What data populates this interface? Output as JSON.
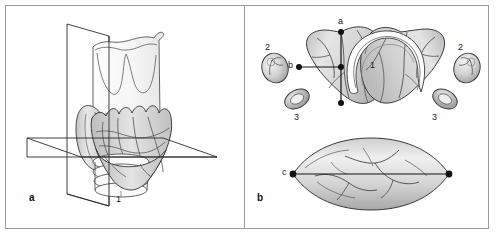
{
  "figure": {
    "background": "#ffffff",
    "frame_color": "#9a9a9a"
  },
  "panels": [
    {
      "letter": "a",
      "name": "three-dimensional-thyroid-with-section-planes",
      "labels": [
        {
          "text": "1",
          "meaning": "trachea",
          "x": 118,
          "y": 200
        }
      ]
    },
    {
      "letter": "b",
      "name": "cross-sectional-views-with-measurement-axes",
      "labels": [
        {
          "text": "1",
          "meaning": "trachea",
          "x": 372,
          "y": 65
        },
        {
          "text": "2",
          "meaning": "parathyroid-gland-superior-left",
          "x": 267,
          "y": 48
        },
        {
          "text": "2",
          "meaning": "parathyroid-gland-superior-right",
          "x": 460,
          "y": 48
        },
        {
          "text": "3",
          "meaning": "parathyroid-gland-inferior-left",
          "x": 296,
          "y": 118
        },
        {
          "text": "3",
          "meaning": "parathyroid-gland-inferior-right",
          "x": 434,
          "y": 118
        },
        {
          "text": "a",
          "meaning": "craniocaudal-axis-marker",
          "x": 340,
          "y": 21
        },
        {
          "text": "b",
          "meaning": "transverse-width-axis-marker",
          "x": 289,
          "y": 62
        },
        {
          "text": "c",
          "meaning": "longitudinal-axis-marker",
          "x": 297,
          "y": 173
        }
      ]
    }
  ],
  "colors": {
    "outline": "#3a3a3a",
    "tissue_fill_light": "#ececec",
    "tissue_fill_mid": "#d7d7d7",
    "tissue_fill_dark": "#bcbcbc",
    "vessel": "#555555",
    "axis_line": "#141414",
    "marker_dot": "#111111",
    "plane_line": "#2b2b2b",
    "frame": "#9a9a9a",
    "text": "#111111"
  },
  "legend": {
    "1": "Trachea",
    "2": "Superior parathyroid gland",
    "3": "Inferior parathyroid gland",
    "a": "Craniocaudal measurement axis",
    "b": "Transverse measurement axis",
    "c": "Longitudinal measurement axis"
  }
}
